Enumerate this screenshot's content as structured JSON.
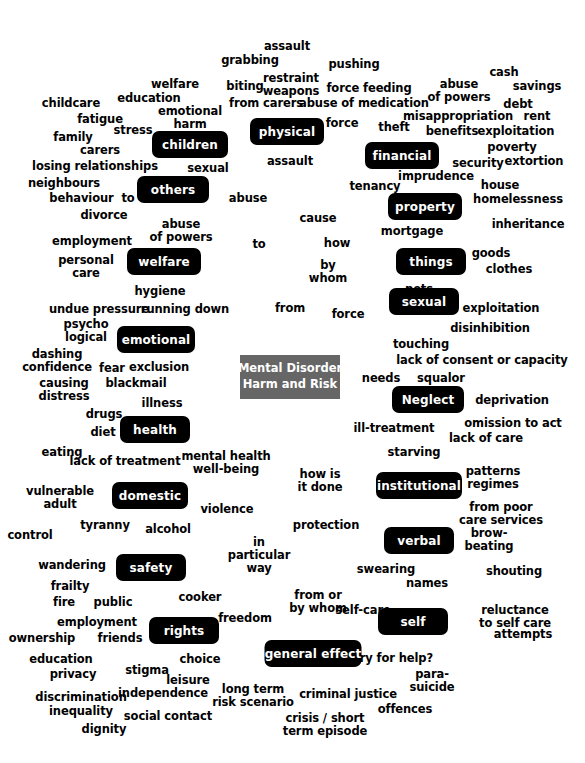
{
  "diagram": {
    "title": "Mental Disorder Harm and Risk",
    "center_node": {
      "label": "Mental Disorder\nHarm and Risk",
      "color": "#666666",
      "text_color": "#ffffff"
    },
    "node_color": "#000000",
    "node_text_color": "#ffffff",
    "term_color": "#000000",
    "background": "#ffffff",
    "nodes": [
      {
        "label": "children",
        "x": 190,
        "y": 131,
        "w": 76,
        "h": 27
      },
      {
        "label": "physical",
        "x": 287,
        "y": 118,
        "w": 74,
        "h": 27
      },
      {
        "label": "financial",
        "x": 402,
        "y": 142,
        "w": 74,
        "h": 27
      },
      {
        "label": "others",
        "x": 173,
        "y": 176,
        "w": 72,
        "h": 27
      },
      {
        "label": "property",
        "x": 425,
        "y": 193,
        "w": 74,
        "h": 27
      },
      {
        "label": "welfare",
        "x": 164,
        "y": 248,
        "w": 74,
        "h": 27
      },
      {
        "label": "things",
        "x": 431,
        "y": 248,
        "w": 70,
        "h": 27
      },
      {
        "label": "sexual",
        "x": 424,
        "y": 288,
        "w": 70,
        "h": 27
      },
      {
        "label": "emotional",
        "x": 156,
        "y": 326,
        "w": 78,
        "h": 27
      },
      {
        "label": "Neglect",
        "x": 428,
        "y": 386,
        "w": 72,
        "h": 27
      },
      {
        "label": "health",
        "x": 155,
        "y": 416,
        "w": 70,
        "h": 27
      },
      {
        "label": "domestic",
        "x": 150,
        "y": 482,
        "w": 76,
        "h": 27
      },
      {
        "label": "institutional",
        "x": 419,
        "y": 472,
        "w": 86,
        "h": 27
      },
      {
        "label": "verbal",
        "x": 419,
        "y": 527,
        "w": 70,
        "h": 27
      },
      {
        "label": "safety",
        "x": 151,
        "y": 554,
        "w": 70,
        "h": 27
      },
      {
        "label": "rights",
        "x": 184,
        "y": 617,
        "w": 70,
        "h": 27
      },
      {
        "label": "self",
        "x": 413,
        "y": 608,
        "w": 70,
        "h": 27
      },
      {
        "label": "general effect",
        "x": 313,
        "y": 640,
        "w": 97,
        "h": 27
      }
    ],
    "terms": [
      {
        "text": "assault",
        "x": 287,
        "y": 40,
        "align": "center"
      },
      {
        "text": "grabbing",
        "x": 250,
        "y": 54,
        "align": "center"
      },
      {
        "text": "pushing",
        "x": 354,
        "y": 58,
        "align": "center"
      },
      {
        "text": "cash",
        "x": 504,
        "y": 66,
        "align": "center"
      },
      {
        "text": "welfare",
        "x": 175,
        "y": 78,
        "align": "center"
      },
      {
        "text": "biting",
        "x": 245,
        "y": 80,
        "align": "center"
      },
      {
        "text": "restraint\nweapons",
        "x": 291,
        "y": 72,
        "align": "center"
      },
      {
        "text": "force feeding",
        "x": 369,
        "y": 82,
        "align": "center"
      },
      {
        "text": "abuse\nof powers",
        "x": 459,
        "y": 78,
        "align": "center"
      },
      {
        "text": "savings",
        "x": 537,
        "y": 80,
        "align": "center"
      },
      {
        "text": "childcare",
        "x": 71,
        "y": 97,
        "align": "center"
      },
      {
        "text": "education",
        "x": 149,
        "y": 92,
        "align": "center"
      },
      {
        "text": "emotional\nharm",
        "x": 190,
        "y": 105,
        "align": "center"
      },
      {
        "text": "from carers",
        "x": 266,
        "y": 97,
        "align": "center"
      },
      {
        "text": "abuse of medication",
        "x": 364,
        "y": 97,
        "align": "center"
      },
      {
        "text": "debt",
        "x": 518,
        "y": 98,
        "align": "center"
      },
      {
        "text": "fatigue",
        "x": 100,
        "y": 113,
        "align": "center"
      },
      {
        "text": "misappropriation",
        "x": 458,
        "y": 110,
        "align": "center"
      },
      {
        "text": "rent",
        "x": 537,
        "y": 110,
        "align": "center"
      },
      {
        "text": "stress",
        "x": 133,
        "y": 124,
        "align": "center"
      },
      {
        "text": "force",
        "x": 342,
        "y": 117,
        "align": "center"
      },
      {
        "text": "theft",
        "x": 394,
        "y": 121,
        "align": "center"
      },
      {
        "text": "benefits",
        "x": 452,
        "y": 125,
        "align": "center"
      },
      {
        "text": "exploitation",
        "x": 516,
        "y": 125,
        "align": "center"
      },
      {
        "text": "family",
        "x": 73,
        "y": 131,
        "align": "center"
      },
      {
        "text": "carers",
        "x": 100,
        "y": 144,
        "align": "center"
      },
      {
        "text": "poverty",
        "x": 512,
        "y": 141,
        "align": "center"
      },
      {
        "text": "losing relationships",
        "x": 95,
        "y": 160,
        "align": "center"
      },
      {
        "text": "sexual",
        "x": 208,
        "y": 162,
        "align": "center"
      },
      {
        "text": "assault",
        "x": 290,
        "y": 155,
        "align": "center"
      },
      {
        "text": "security",
        "x": 478,
        "y": 157,
        "align": "center"
      },
      {
        "text": "extortion",
        "x": 534,
        "y": 155,
        "align": "center"
      },
      {
        "text": "neighbours",
        "x": 64,
        "y": 177,
        "align": "center"
      },
      {
        "text": "imprudence",
        "x": 436,
        "y": 170,
        "align": "center"
      },
      {
        "text": "tenancy",
        "x": 375,
        "y": 180,
        "align": "center"
      },
      {
        "text": "house",
        "x": 500,
        "y": 179,
        "align": "center"
      },
      {
        "text": "behaviour  to",
        "x": 92,
        "y": 192,
        "align": "center"
      },
      {
        "text": "abuse",
        "x": 248,
        "y": 192,
        "align": "center"
      },
      {
        "text": "homelessness",
        "x": 518,
        "y": 193,
        "align": "center"
      },
      {
        "text": "divorce",
        "x": 104,
        "y": 209,
        "align": "center"
      },
      {
        "text": "cause",
        "x": 318,
        "y": 212,
        "align": "center"
      },
      {
        "text": "abuse\nof powers",
        "x": 181,
        "y": 218,
        "align": "center"
      },
      {
        "text": "inheritance",
        "x": 528,
        "y": 218,
        "align": "center"
      },
      {
        "text": "employment",
        "x": 92,
        "y": 235,
        "align": "center"
      },
      {
        "text": "mortgage",
        "x": 412,
        "y": 225,
        "align": "center"
      },
      {
        "text": "how",
        "x": 337,
        "y": 237,
        "align": "center"
      },
      {
        "text": "to",
        "x": 259,
        "y": 238,
        "align": "center"
      },
      {
        "text": "personal\ncare",
        "x": 86,
        "y": 254,
        "align": "center"
      },
      {
        "text": "goods",
        "x": 491,
        "y": 247,
        "align": "center"
      },
      {
        "text": "by\nwhom",
        "x": 328,
        "y": 259,
        "align": "center"
      },
      {
        "text": "clothes",
        "x": 509,
        "y": 263,
        "align": "center"
      },
      {
        "text": "hygiene",
        "x": 160,
        "y": 285,
        "align": "center"
      },
      {
        "text": "pets",
        "x": 419,
        "y": 283,
        "align": "center"
      },
      {
        "text": "undue pressure",
        "x": 99,
        "y": 303,
        "align": "center"
      },
      {
        "text": "running down",
        "x": 185,
        "y": 303,
        "align": "center"
      },
      {
        "text": "from",
        "x": 290,
        "y": 302,
        "align": "center"
      },
      {
        "text": "force",
        "x": 348,
        "y": 308,
        "align": "center"
      },
      {
        "text": "exploitation",
        "x": 501,
        "y": 302,
        "align": "center"
      },
      {
        "text": "psycho\nlogical",
        "x": 86,
        "y": 318,
        "align": "center"
      },
      {
        "text": "disinhibition",
        "x": 490,
        "y": 322,
        "align": "center"
      },
      {
        "text": "touching",
        "x": 421,
        "y": 338,
        "align": "center"
      },
      {
        "text": "dashing\nconfidence",
        "x": 57,
        "y": 348,
        "align": "center"
      },
      {
        "text": "fear",
        "x": 112,
        "y": 362,
        "align": "center"
      },
      {
        "text": "exclusion",
        "x": 159,
        "y": 361,
        "align": "center"
      },
      {
        "text": "lack of consent or capacity",
        "x": 482,
        "y": 354,
        "align": "center"
      },
      {
        "text": "causing\ndistress",
        "x": 64,
        "y": 377,
        "align": "center"
      },
      {
        "text": "blackmail",
        "x": 136,
        "y": 377,
        "align": "center"
      },
      {
        "text": "needs",
        "x": 381,
        "y": 372,
        "align": "center"
      },
      {
        "text": "squalor",
        "x": 441,
        "y": 372,
        "align": "center"
      },
      {
        "text": "illness",
        "x": 162,
        "y": 397,
        "align": "center"
      },
      {
        "text": "deprivation",
        "x": 512,
        "y": 394,
        "align": "center"
      },
      {
        "text": "drugs",
        "x": 104,
        "y": 408,
        "align": "center"
      },
      {
        "text": "omission to act",
        "x": 513,
        "y": 417,
        "align": "center"
      },
      {
        "text": "diet",
        "x": 103,
        "y": 426,
        "align": "center"
      },
      {
        "text": "ill-treatment",
        "x": 394,
        "y": 422,
        "align": "center"
      },
      {
        "text": "lack of care",
        "x": 486,
        "y": 432,
        "align": "center"
      },
      {
        "text": "eating",
        "x": 62,
        "y": 446,
        "align": "center"
      },
      {
        "text": "mental health\nwell-being",
        "x": 226,
        "y": 450,
        "align": "center"
      },
      {
        "text": "starving",
        "x": 414,
        "y": 446,
        "align": "center"
      },
      {
        "text": "lack of treatment",
        "x": 125,
        "y": 455,
        "align": "center"
      },
      {
        "text": "how is\nit done",
        "x": 320,
        "y": 468,
        "align": "center"
      },
      {
        "text": "patterns\nregimes",
        "x": 493,
        "y": 465,
        "align": "center"
      },
      {
        "text": "vulnerable\nadult",
        "x": 60,
        "y": 485,
        "align": "center"
      },
      {
        "text": "violence",
        "x": 227,
        "y": 503,
        "align": "center"
      },
      {
        "text": "from poor\ncare services",
        "x": 501,
        "y": 501,
        "align": "center"
      },
      {
        "text": "tyranny",
        "x": 105,
        "y": 519,
        "align": "center"
      },
      {
        "text": "alcohol",
        "x": 168,
        "y": 523,
        "align": "center"
      },
      {
        "text": "protection",
        "x": 326,
        "y": 519,
        "align": "center"
      },
      {
        "text": "control",
        "x": 30,
        "y": 529,
        "align": "center"
      },
      {
        "text": "in\nparticular\nway",
        "x": 259,
        "y": 536,
        "align": "center"
      },
      {
        "text": "brow-\nbeating",
        "x": 489,
        "y": 527,
        "align": "center"
      },
      {
        "text": "wandering",
        "x": 72,
        "y": 559,
        "align": "center"
      },
      {
        "text": "swearing",
        "x": 386,
        "y": 563,
        "align": "center"
      },
      {
        "text": "names",
        "x": 427,
        "y": 577,
        "align": "center"
      },
      {
        "text": "shouting",
        "x": 514,
        "y": 565,
        "align": "center"
      },
      {
        "text": "frailty",
        "x": 70,
        "y": 580,
        "align": "center"
      },
      {
        "text": "fire",
        "x": 64,
        "y": 596,
        "align": "center"
      },
      {
        "text": "public",
        "x": 113,
        "y": 596,
        "align": "center"
      },
      {
        "text": "cooker",
        "x": 200,
        "y": 591,
        "align": "center"
      },
      {
        "text": "from or\nby whom",
        "x": 318,
        "y": 589,
        "align": "center"
      },
      {
        "text": "freedom",
        "x": 245,
        "y": 612,
        "align": "center"
      },
      {
        "text": "self-care",
        "x": 363,
        "y": 604,
        "align": "center"
      },
      {
        "text": "reluctance\nto self care",
        "x": 515,
        "y": 604,
        "align": "center"
      },
      {
        "text": "employment",
        "x": 97,
        "y": 616,
        "align": "center"
      },
      {
        "text": "ownership",
        "x": 42,
        "y": 632,
        "align": "center"
      },
      {
        "text": "friends",
        "x": 120,
        "y": 632,
        "align": "center"
      },
      {
        "text": "attempts",
        "x": 523,
        "y": 628,
        "align": "center"
      },
      {
        "text": "education",
        "x": 61,
        "y": 653,
        "align": "center"
      },
      {
        "text": "choice",
        "x": 200,
        "y": 653,
        "align": "center"
      },
      {
        "text": "cry for help?",
        "x": 393,
        "y": 652,
        "align": "center"
      },
      {
        "text": "stigma",
        "x": 147,
        "y": 664,
        "align": "center"
      },
      {
        "text": "privacy",
        "x": 73,
        "y": 668,
        "align": "center"
      },
      {
        "text": "leisure",
        "x": 188,
        "y": 674,
        "align": "center"
      },
      {
        "text": "para-\nsuicide",
        "x": 432,
        "y": 668,
        "align": "center"
      },
      {
        "text": "independence",
        "x": 163,
        "y": 687,
        "align": "center"
      },
      {
        "text": "long term\nrisk scenario",
        "x": 253,
        "y": 683,
        "align": "center"
      },
      {
        "text": "discrimination",
        "x": 81,
        "y": 691,
        "align": "center"
      },
      {
        "text": "criminal justice",
        "x": 348,
        "y": 688,
        "align": "center"
      },
      {
        "text": "inequality",
        "x": 81,
        "y": 705,
        "align": "center"
      },
      {
        "text": "social contact",
        "x": 168,
        "y": 710,
        "align": "center"
      },
      {
        "text": "offences",
        "x": 405,
        "y": 703,
        "align": "center"
      },
      {
        "text": "dignity",
        "x": 104,
        "y": 723,
        "align": "center"
      },
      {
        "text": "crisis / short\nterm episode",
        "x": 325,
        "y": 712,
        "align": "center"
      }
    ]
  }
}
